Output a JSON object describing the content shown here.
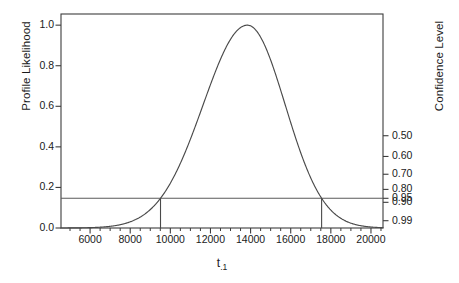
{
  "chart_data": {
    "type": "line",
    "title": "",
    "xlabel": "t",
    "xlabel_sub": ".1",
    "ylabel": "Profile Likelihood",
    "ylabel_secondary": "Confidence Level",
    "xlim": [
      4550,
      20600
    ],
    "ylim": [
      0.0,
      1.055
    ],
    "grid": false,
    "legend": "none",
    "x_ticks": [
      6000,
      8000,
      10000,
      12000,
      14000,
      16000,
      18000,
      20000
    ],
    "x_tick_labels": [
      "6000",
      "8000",
      "10000",
      "12000",
      "14000",
      "16000",
      "18000",
      "20000"
    ],
    "x_minor_tick_step": 500,
    "y_ticks": [
      0.0,
      0.2,
      0.4,
      0.6,
      0.8,
      1.0
    ],
    "y_tick_labels": [
      "0.0",
      "0.2",
      "0.4",
      "0.6",
      "0.8",
      "1.0"
    ],
    "y2_ticks": [
      0.5,
      0.4,
      0.3,
      0.2,
      0.1,
      0.05,
      0.01
    ],
    "y2_tick_labels": [
      "0.50",
      "0.60",
      "0.70",
      "0.80",
      "0.90",
      "0.95",
      "0.99"
    ],
    "y2_tick_values": [
      0.4549,
      0.3527,
      0.265,
      0.1903,
      0.1266,
      0.1464,
      0.036
    ],
    "reference_line": {
      "orientation": "horizontal",
      "y": 0.1465,
      "label": "0.95 confidence level"
    },
    "interval_bounds": {
      "lower": 9510,
      "upper": 17540
    },
    "series": [
      {
        "name": "profile likelihood",
        "peak_x": 13840,
        "peak_y": 1.0,
        "x": [
          4550,
          5000,
          5500,
          6000,
          6500,
          7000,
          7500,
          8000,
          8500,
          9000,
          9510,
          10000,
          10500,
          11000,
          11500,
          12000,
          12500,
          13000,
          13400,
          13840,
          14200,
          14700,
          15200,
          15700,
          16200,
          16700,
          17200,
          17540,
          18000,
          18500,
          19000,
          19500,
          20000,
          20600
        ],
        "y": [
          0.0015,
          0.0025,
          0.0045,
          0.0085,
          0.0155,
          0.0275,
          0.047,
          0.076,
          0.115,
          0.168,
          0.1465,
          0.305,
          0.405,
          0.525,
          0.655,
          0.785,
          0.895,
          0.975,
          0.997,
          1.0,
          0.985,
          0.935,
          0.855,
          0.745,
          0.615,
          0.475,
          0.345,
          0.1465,
          0.215,
          0.145,
          0.096,
          0.062,
          0.041,
          0.026
        ]
      }
    ]
  },
  "axes": {
    "left_label": "Profile Likelihood",
    "right_label": "Confidence Level",
    "bottom_label_main": "t",
    "bottom_label_sub": ".1"
  },
  "colors": {
    "frame": "#3c3c3c",
    "curve": "#4a4a4a",
    "reference_line": "#5a5a5a",
    "text": "#1a1a1a",
    "background": "#ffffff"
  }
}
